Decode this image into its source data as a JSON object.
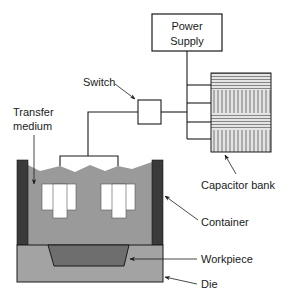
{
  "diagram": {
    "type": "electrohydraulic-forming-schematic",
    "colors": {
      "line": "#1a1a1a",
      "container_wall": "#3a3a3a",
      "transfer_medium": "#9a9a9a",
      "die": "#a3a3a3",
      "workpiece": "#6e6e6e",
      "electrode": "#ffffff",
      "capacitor_fill": "#e4e4e4"
    },
    "components": {
      "power_supply": {
        "line1": "Power",
        "line2": "Supply"
      },
      "switch": {
        "label": "Switch"
      },
      "capacitor_bank": {
        "label": "Capacitor bank"
      },
      "transfer_medium": {
        "line1": "Transfer",
        "line2": "medium"
      },
      "container": {
        "label": "Container"
      },
      "workpiece": {
        "label": "Workpiece"
      },
      "die": {
        "label": "Die"
      }
    }
  }
}
